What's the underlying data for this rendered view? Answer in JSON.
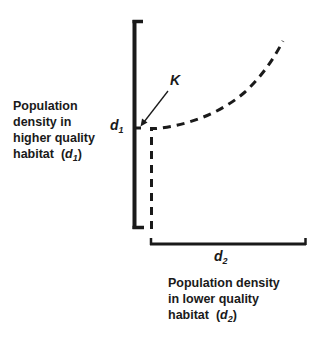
{
  "diagram": {
    "y_axis_label": {
      "lines": [
        "Population",
        "density in",
        "higher quality",
        "habitat"
      ],
      "symbol": "d",
      "subscript": "1"
    },
    "x_axis_label": {
      "lines": [
        "Population density",
        "in lower quality",
        "habitat"
      ],
      "symbol": "d",
      "subscript": "2"
    },
    "y_tick_label": {
      "symbol": "d",
      "subscript": "1"
    },
    "x_tick_label": {
      "symbol": "d",
      "subscript": "2"
    },
    "annotation": {
      "label": "K",
      "points_to": "d1 threshold on vertical axis"
    },
    "curve": {
      "style": "dashed",
      "description": "Dashed line vertical at d2 = 0 up to d1 = K, then curving upward as d2 increases"
    },
    "colors": {
      "ink": "#1a1a1a",
      "background": "#ffffff"
    }
  }
}
